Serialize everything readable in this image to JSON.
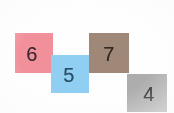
{
  "scene": {
    "title": "Colored number squares",
    "background_color": "#fefefe",
    "width": 174,
    "height": 113
  },
  "tiles": [
    {
      "name": "pink-square",
      "label": "6",
      "color": "#f1909a",
      "text_color": "#3a2a32",
      "position": "upper-left"
    },
    {
      "name": "blue-square",
      "label": "5",
      "color": "#91cff2",
      "text_color": "#27506b",
      "position": "center-lower"
    },
    {
      "name": "brown-square",
      "label": "7",
      "color": "#a08878",
      "text_color": "#332821",
      "position": "upper-right"
    },
    {
      "name": "gray-square",
      "label": "4",
      "color": "#adadad",
      "text_color": "#2b2b2b",
      "position": "lower-right"
    }
  ]
}
